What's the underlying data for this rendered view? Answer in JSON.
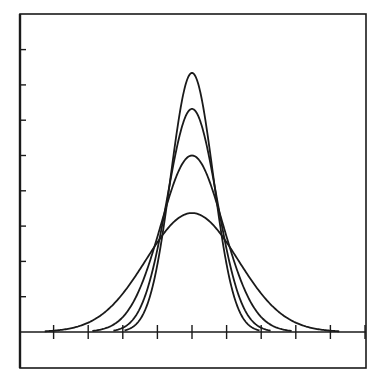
{
  "chart_data": {
    "type": "line",
    "title": "",
    "xlabel": "",
    "ylabel": "",
    "x_ticks": [
      -4,
      -3,
      -2,
      -1,
      0,
      1,
      2,
      3,
      4
    ],
    "x_tick_labels": [],
    "y_ticks": [
      1,
      2,
      3,
      4,
      5,
      6,
      7,
      8
    ],
    "y_tick_labels": [],
    "xlim": [
      -5,
      5
    ],
    "ylim": [
      -1,
      9
    ],
    "grid": false,
    "legend": null,
    "series": [
      {
        "name": "curve-1 (widest)",
        "mean": 0,
        "sigma": 1.33,
        "peak": 3.37
      },
      {
        "name": "curve-2",
        "mean": 0,
        "sigma": 0.9,
        "peak": 5.0
      },
      {
        "name": "curve-3",
        "mean": 0,
        "sigma": 0.71,
        "peak": 6.32
      },
      {
        "name": "curve-4 (narrowest)",
        "mean": 0,
        "sigma": 0.61,
        "peak": 7.34
      }
    ]
  },
  "style": {
    "line_color": "#1a1a1a",
    "background": "#ffffff"
  }
}
